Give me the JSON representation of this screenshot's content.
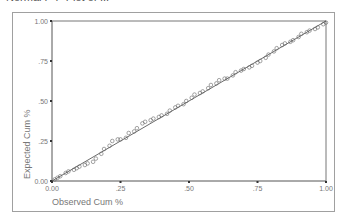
{
  "chart": {
    "title_partial": "Normal P-P Plot of ...",
    "xlabel": "Observed Cum %",
    "ylabel": "Expected Cum %",
    "x_ticks": [
      ".00|0.00",
      ".25",
      ".50",
      ".75",
      "1.00"
    ],
    "y_ticks": [
      "0.00",
      ".25",
      ".50",
      ".75",
      "1.00"
    ]
  },
  "chart_data": {
    "type": "scatter",
    "title": "",
    "xlabel": "Observed Cum %",
    "ylabel": "Expected Cum %",
    "xlim": [
      0,
      1
    ],
    "ylim": [
      0,
      1
    ],
    "grid": false,
    "x_tick_labels": [
      "0.00",
      ".25",
      ".50",
      ".75",
      "1.00"
    ],
    "y_tick_labels": [
      "0.00",
      ".25",
      ".50",
      ".75",
      "1.00"
    ],
    "reference_line": {
      "from": [
        0,
        0
      ],
      "to": [
        1,
        1
      ]
    },
    "series": [
      {
        "name": "observed",
        "marker": "circle",
        "points": [
          [
            0.01,
            0.01
          ],
          [
            0.02,
            0.02
          ],
          [
            0.03,
            0.03
          ],
          [
            0.05,
            0.05
          ],
          [
            0.06,
            0.06
          ],
          [
            0.08,
            0.07
          ],
          [
            0.09,
            0.08
          ],
          [
            0.1,
            0.09
          ],
          [
            0.12,
            0.1
          ],
          [
            0.13,
            0.11
          ],
          [
            0.15,
            0.12
          ],
          [
            0.16,
            0.14
          ],
          [
            0.18,
            0.17
          ],
          [
            0.19,
            0.2
          ],
          [
            0.21,
            0.22
          ],
          [
            0.22,
            0.25
          ],
          [
            0.24,
            0.26
          ],
          [
            0.25,
            0.26
          ],
          [
            0.27,
            0.27
          ],
          [
            0.28,
            0.3
          ],
          [
            0.3,
            0.31
          ],
          [
            0.31,
            0.33
          ],
          [
            0.33,
            0.36
          ],
          [
            0.34,
            0.37
          ],
          [
            0.36,
            0.38
          ],
          [
            0.37,
            0.39
          ],
          [
            0.39,
            0.4
          ],
          [
            0.4,
            0.41
          ],
          [
            0.42,
            0.42
          ],
          [
            0.43,
            0.44
          ],
          [
            0.45,
            0.46
          ],
          [
            0.46,
            0.47
          ],
          [
            0.48,
            0.48
          ],
          [
            0.49,
            0.5
          ],
          [
            0.51,
            0.52
          ],
          [
            0.52,
            0.54
          ],
          [
            0.54,
            0.55
          ],
          [
            0.55,
            0.56
          ],
          [
            0.57,
            0.58
          ],
          [
            0.58,
            0.6
          ],
          [
            0.6,
            0.61
          ],
          [
            0.61,
            0.63
          ],
          [
            0.63,
            0.64
          ],
          [
            0.64,
            0.64
          ],
          [
            0.66,
            0.66
          ],
          [
            0.67,
            0.68
          ],
          [
            0.69,
            0.69
          ],
          [
            0.7,
            0.7
          ],
          [
            0.72,
            0.71
          ],
          [
            0.73,
            0.72
          ],
          [
            0.75,
            0.74
          ],
          [
            0.76,
            0.75
          ],
          [
            0.78,
            0.77
          ],
          [
            0.79,
            0.79
          ],
          [
            0.81,
            0.81
          ],
          [
            0.82,
            0.83
          ],
          [
            0.84,
            0.85
          ],
          [
            0.85,
            0.86
          ],
          [
            0.87,
            0.87
          ],
          [
            0.88,
            0.88
          ],
          [
            0.9,
            0.9
          ],
          [
            0.91,
            0.92
          ],
          [
            0.93,
            0.93
          ],
          [
            0.94,
            0.94
          ],
          [
            0.96,
            0.95
          ],
          [
            0.97,
            0.96
          ],
          [
            0.99,
            0.98
          ],
          [
            1.0,
            0.99
          ]
        ]
      }
    ]
  }
}
